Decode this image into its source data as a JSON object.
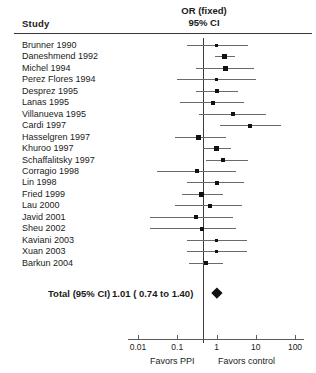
{
  "header": {
    "study_column": "Study",
    "effect_title_line1": "OR (fixed)",
    "effect_title_line2": "95% CI"
  },
  "total": {
    "label": "Total (95% CI)",
    "value_text": "1.01 ( 0.74 to 1.40)"
  },
  "axis": {
    "tick_labels": [
      "0.01",
      "0.1",
      "1",
      "10",
      "100"
    ],
    "favors_left": "Favors PPI",
    "favors_right": "Favors control"
  },
  "chart_data": {
    "type": "forest",
    "title": "OR (fixed) 95% CI",
    "xlabel": "Odds Ratio (log scale)",
    "ylabel": "Study",
    "xscale": "log",
    "xlim": [
      0.01,
      100
    ],
    "xticks": [
      0.01,
      0.1,
      1,
      10,
      100
    ],
    "null_value": 1,
    "grid": false,
    "legend": "none",
    "left_annotation": "Favors PPI",
    "right_annotation": "Favors control",
    "categories": [
      "Brunner 1990",
      "Daneshmend 1992",
      "Michel 1994",
      "Perez Flores 1994",
      "Desprez 1995",
      "Lanas 1995",
      "Villanueva 1995",
      "Cardi 1997",
      "Hasselgren 1997",
      "Khuroo 1997",
      "Schaffalitsky 1997",
      "Corragio 1998",
      "Lin 1998",
      "Fried 1999",
      "Lau 2000",
      "Javid 2001",
      "Sheu 2002",
      "Kaviani 2003",
      "Xuan 2003",
      "Barkun 2004"
    ],
    "studies": [
      {
        "name": "Brunner 1990",
        "or": 1.0,
        "ci_low": 0.18,
        "ci_high": 6.3,
        "weight": 3
      },
      {
        "name": "Daneshmend 1992",
        "or": 1.6,
        "ci_low": 0.9,
        "ci_high": 3.0,
        "weight": 5
      },
      {
        "name": "Michel 1994",
        "or": 1.65,
        "ci_low": 0.3,
        "ci_high": 9.0,
        "weight": 5
      },
      {
        "name": "Perez Flores 1994",
        "or": 1.0,
        "ci_low": 0.1,
        "ci_high": 10.0,
        "weight": 3
      },
      {
        "name": "Desprez 1995",
        "or": 1.0,
        "ci_low": 0.3,
        "ci_high": 3.5,
        "weight": 4
      },
      {
        "name": "Lanas 1995",
        "or": 0.8,
        "ci_low": 0.12,
        "ci_high": 5.0,
        "weight": 4
      },
      {
        "name": "Villanueva 1995",
        "or": 2.6,
        "ci_low": 0.35,
        "ci_high": 18.0,
        "weight": 4
      },
      {
        "name": "Cardi 1997",
        "or": 7.0,
        "ci_low": 1.2,
        "ci_high": 45.0,
        "weight": 4
      },
      {
        "name": "Hasselgren 1997",
        "or": 0.35,
        "ci_low": 0.09,
        "ci_high": 1.7,
        "weight": 5
      },
      {
        "name": "Khuroo 1997",
        "or": 1.0,
        "ci_low": 0.45,
        "ci_high": 2.4,
        "weight": 5
      },
      {
        "name": "Schaffalitsky 1997",
        "or": 1.5,
        "ci_low": 0.55,
        "ci_high": 6.5,
        "weight": 4
      },
      {
        "name": "Corragio 1998",
        "or": 0.32,
        "ci_low": 0.03,
        "ci_high": 3.2,
        "weight": 4
      },
      {
        "name": "Lin 1998",
        "or": 1.0,
        "ci_low": 0.18,
        "ci_high": 5.0,
        "weight": 4
      },
      {
        "name": "Fried 1999",
        "or": 0.42,
        "ci_low": 0.13,
        "ci_high": 1.5,
        "weight": 5
      },
      {
        "name": "Lau 2000",
        "or": 0.7,
        "ci_low": 0.09,
        "ci_high": 4.5,
        "weight": 4
      },
      {
        "name": "Javid 2001",
        "or": 0.3,
        "ci_low": 0.02,
        "ci_high": 2.6,
        "weight": 4
      },
      {
        "name": "Sheu 2002",
        "or": 0.42,
        "ci_low": 0.02,
        "ci_high": 3.2,
        "weight": 4
      },
      {
        "name": "Kaviani 2003",
        "or": 1.0,
        "ci_low": 0.18,
        "ci_high": 6.0,
        "weight": 3
      },
      {
        "name": "Xuan 2003",
        "or": 1.0,
        "ci_low": 0.18,
        "ci_high": 6.0,
        "weight": 3
      },
      {
        "name": "Barkun 2004",
        "or": 0.55,
        "ci_low": 0.2,
        "ci_high": 1.5,
        "weight": 4
      }
    ],
    "summary": {
      "label": "Total (95% CI)",
      "or": 1.01,
      "ci_low": 0.74,
      "ci_high": 1.4,
      "text": "1.01 ( 0.74 to 1.40)"
    }
  }
}
